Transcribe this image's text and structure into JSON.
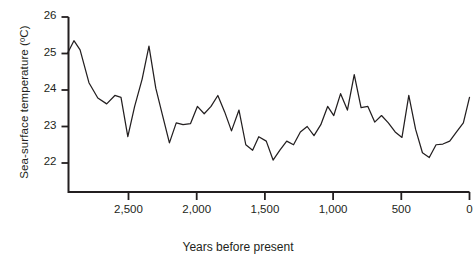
{
  "chart_data": {
    "type": "line",
    "title": "",
    "xlabel": "Years before present",
    "ylabel": "Sea-surface temperature (ºC)",
    "xlim": [
      2950,
      0
    ],
    "ylim": [
      21.4,
      26.0
    ],
    "x_reversed": true,
    "grid": false,
    "legend": null,
    "xticks": [
      2500,
      2000,
      1500,
      1000,
      500,
      0
    ],
    "xtick_labels": [
      "2,500",
      "2,000",
      "1,500",
      "1,000",
      "500",
      "0"
    ],
    "yticks": [
      22,
      23,
      24,
      25,
      26
    ],
    "ytick_labels": [
      "22",
      "23",
      "24",
      "25",
      "26"
    ],
    "series": [
      {
        "name": "Sea-surface temperature",
        "color": "#231f20",
        "x": [
          2945,
          2900,
          2855,
          2790,
          2725,
          2660,
          2600,
          2555,
          2505,
          2455,
          2400,
          2350,
          2300,
          2250,
          2200,
          2150,
          2100,
          2045,
          1995,
          1945,
          1895,
          1845,
          1795,
          1745,
          1690,
          1640,
          1590,
          1545,
          1490,
          1440,
          1390,
          1340,
          1290,
          1240,
          1190,
          1140,
          1090,
          1040,
          995,
          945,
          895,
          845,
          795,
          745,
          695,
          645,
          595,
          545,
          495,
          445,
          395,
          345,
          295,
          245,
          195,
          145,
          95,
          45,
          0
        ],
        "y": [
          25.02,
          25.35,
          25.1,
          24.2,
          23.78,
          23.62,
          23.85,
          23.8,
          22.72,
          23.55,
          24.3,
          25.2,
          24.05,
          23.3,
          22.55,
          23.1,
          23.05,
          23.08,
          23.55,
          23.35,
          23.55,
          23.85,
          23.4,
          22.88,
          23.45,
          22.5,
          22.35,
          22.72,
          22.6,
          22.08,
          22.35,
          22.6,
          22.5,
          22.85,
          23.0,
          22.75,
          23.05,
          23.55,
          23.3,
          23.9,
          23.45,
          24.42,
          23.52,
          23.55,
          23.12,
          23.3,
          23.1,
          22.85,
          22.7,
          23.85,
          22.92,
          22.28,
          22.15,
          22.5,
          22.52,
          22.6,
          22.85,
          23.1,
          23.8
        ]
      }
    ]
  },
  "axes": {
    "y_axis_name": "sea-surface-temperature-axis",
    "x_axis_name": "years-before-present-axis"
  }
}
